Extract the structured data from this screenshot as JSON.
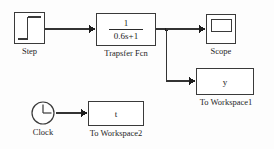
{
  "diagram": {
    "background_color": "#fdfdfd",
    "line_color": "#333333",
    "blocks": [
      {
        "id": "step",
        "type": "source",
        "icon": "step-waveform-icon",
        "caption": "Step",
        "body_text": ""
      },
      {
        "id": "transfer_fcn",
        "type": "continuous",
        "icon": "transfer-function-icon",
        "caption": "Trapsfer Fcn",
        "numerator": "1",
        "denominator": "0.6s+1"
      },
      {
        "id": "scope",
        "type": "sink",
        "icon": "scope-screen-icon",
        "caption": "Scope",
        "body_text": ""
      },
      {
        "id": "to_workspace1",
        "type": "sink",
        "icon": "to-workspace-icon",
        "caption": "To Workspace1",
        "body_text": "y"
      },
      {
        "id": "clock",
        "type": "source",
        "icon": "clock-icon",
        "caption": "Clock",
        "body_text": ""
      },
      {
        "id": "to_workspace2",
        "type": "sink",
        "icon": "to-workspace-icon",
        "caption": "To Workspace2",
        "body_text": "t"
      }
    ],
    "connections": [
      {
        "id": "step-to-tf",
        "from": "step",
        "to": "transfer_fcn"
      },
      {
        "id": "tf-to-scope",
        "from": "transfer_fcn",
        "to": "scope"
      },
      {
        "id": "tf-to-workspace1",
        "from": "transfer_fcn",
        "to": "to_workspace1"
      },
      {
        "id": "clock-to-workspace2",
        "from": "clock",
        "to": "to_workspace2"
      }
    ]
  }
}
